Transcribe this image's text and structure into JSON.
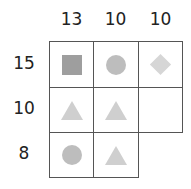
{
  "puzzle": {
    "column_sums": [
      "13",
      "10",
      "10"
    ],
    "row_sums": [
      "15",
      "10",
      "8"
    ],
    "grid": [
      [
        "square",
        "circle",
        "diamond"
      ],
      [
        "triangle",
        "triangle",
        "empty"
      ],
      [
        "circle",
        "triangle",
        null
      ]
    ],
    "colors": {
      "square": "#9e9e9e",
      "circle": "#bdbdbd",
      "triangle": "#cfcfcf",
      "diamond": "#d6d6d6",
      "border": "#555555"
    }
  }
}
